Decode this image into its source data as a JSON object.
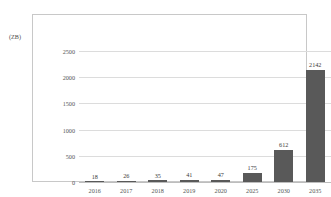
{
  "top_caption": "",
  "unit_label": "(ZB)",
  "chart_data": {
    "type": "bar",
    "title": "",
    "subtitle": "",
    "xlabel": "",
    "ylabel": "(ZB)",
    "categories": [
      "2016",
      "2017",
      "2018",
      "2019",
      "2020",
      "2025",
      "2030",
      "2035"
    ],
    "values": [
      18,
      26,
      35,
      41,
      47,
      175,
      612,
      2142
    ],
    "data_labels": [
      "18",
      "26",
      "35",
      "41",
      "47",
      "175",
      "612",
      "2142"
    ],
    "yticks": [
      2500,
      2000,
      1500,
      1000,
      500,
      0
    ],
    "ytick_labels": [
      "2500",
      "2000",
      "1500",
      "1000",
      "500",
      "0"
    ],
    "ylim": [
      0,
      2500
    ],
    "grid": true,
    "legend": "none",
    "series": [
      {
        "name": "Data volume",
        "values": [
          18,
          26,
          35,
          41,
          47,
          175,
          612,
          2142
        ],
        "color": "#595959"
      }
    ],
    "colors": {
      "bar": "#595959",
      "gridline": "#dcdcdc",
      "frame": "#c8c8c8",
      "text": "#555555",
      "background": "#ffffff"
    }
  }
}
